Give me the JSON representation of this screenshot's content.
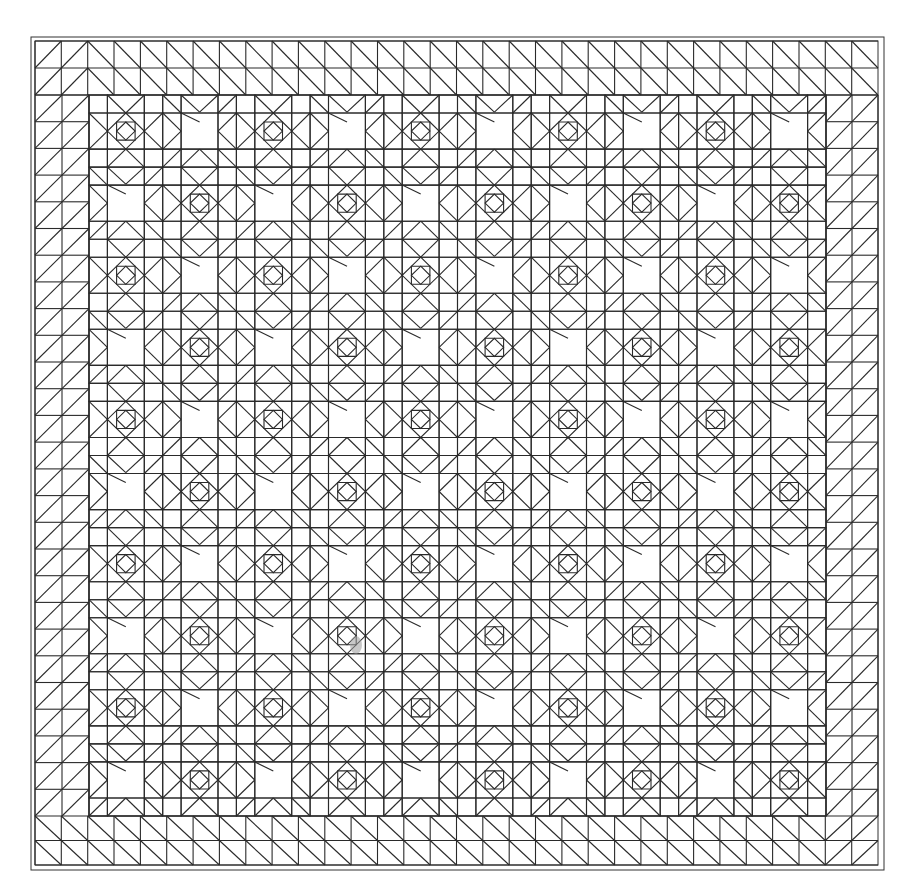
{
  "drawing": {
    "title": "",
    "subject": "quilt-pattern-line-drawing",
    "stroke_color": "#2a2a2a",
    "background_color": "#ffffff",
    "outer_frame": {
      "x": 31,
      "y": 37,
      "w": 853,
      "h": 833
    },
    "inner_frame": {
      "x": 35,
      "y": 41,
      "w": 843,
      "h": 824
    },
    "border": {
      "pattern": "half-square-triangles",
      "rows": 2,
      "cols_top": 32,
      "rows_side": 31
    },
    "body": {
      "x": 89,
      "y": 95,
      "w": 737,
      "h": 721,
      "block_cols": 10,
      "block_rows": 10,
      "units_per_block": 4,
      "block_types": [
        "square-in-square",
        "sawtooth-star"
      ],
      "arrangement": "alternating-checkerboard"
    },
    "smudge": {
      "x": 356,
      "y": 645
    }
  }
}
